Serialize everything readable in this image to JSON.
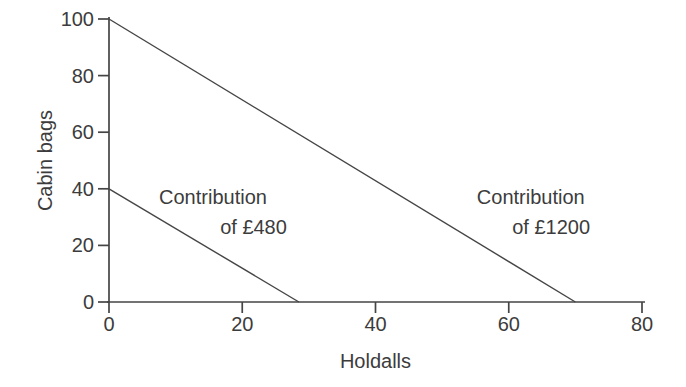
{
  "figure": {
    "background": "#ffffff"
  },
  "chart_data": {
    "type": "line",
    "title": "",
    "xlabel": "Holdalls",
    "ylabel": "Cabin bags",
    "xlim": [
      0,
      80
    ],
    "ylim": [
      0,
      100
    ],
    "x_ticks": [
      0,
      20,
      40,
      60,
      80
    ],
    "y_ticks": [
      0,
      20,
      40,
      60,
      80,
      100
    ],
    "grid": false,
    "legend_position": "none (inline annotations)",
    "axis_color": "#454545",
    "text_color": "#3c3c3c",
    "series": [
      {
        "name": "Contribution of £1200",
        "points": [
          [
            0,
            100
          ],
          [
            70,
            0
          ]
        ],
        "color": "#454545",
        "description": "iso-contribution line, x-intercept ~70 holdalls, y-intercept 100 cabin bags"
      },
      {
        "name": "Contribution of £480",
        "points": [
          [
            0,
            40
          ],
          [
            28.5,
            0
          ]
        ],
        "color": "#454545",
        "description": "iso-contribution line, x-intercept ~28.5 holdalls, y-intercept 40 cabin bags"
      }
    ],
    "annotations": [
      {
        "lines": [
          "Contribution",
          "of £480"
        ],
        "x_end": [
          23.7,
          26.7
        ],
        "y_base": [
          34.6,
          24.0
        ],
        "align": "right"
      },
      {
        "lines": [
          "Contribution",
          "of £1200"
        ],
        "x_end": [
          71.4,
          72.2
        ],
        "y_base": [
          34.6,
          24.0
        ],
        "align": "right"
      }
    ]
  }
}
